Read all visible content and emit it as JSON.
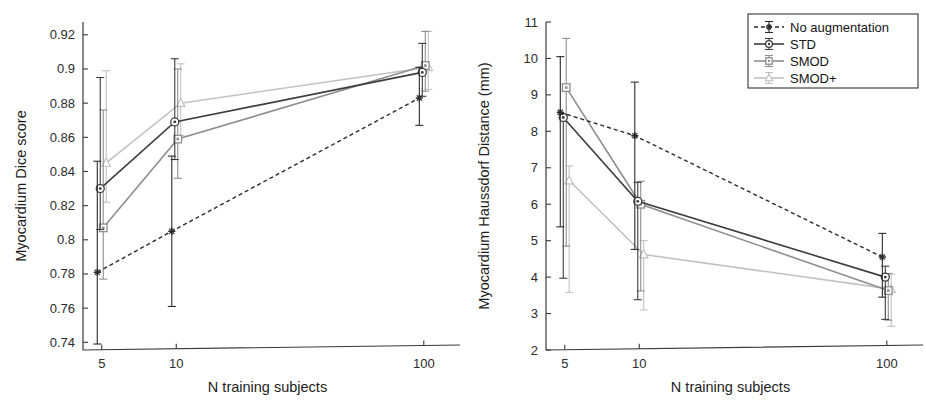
{
  "figure": {
    "title": "",
    "panels": [
      "left",
      "right"
    ]
  },
  "legend": {
    "position": "top-right-of-right-panel",
    "entries": [
      {
        "label": "No augmentation",
        "color": "#2b2b2b",
        "dash": "4,3",
        "marker": "star"
      },
      {
        "label": "STD",
        "color": "#3d3d3d",
        "dash": "none",
        "marker": "circle"
      },
      {
        "label": "SMOD",
        "color": "#8e8e8e",
        "dash": "none",
        "marker": "square"
      },
      {
        "label": "SMOD+",
        "color": "#c2c2c2",
        "dash": "none",
        "marker": "triangle"
      }
    ]
  },
  "chart_data": [
    {
      "id": "dice",
      "type": "line",
      "title": "",
      "xlabel": "N training subjects",
      "ylabel": "Myocardium Dice score",
      "xscale": "log",
      "x": [
        5,
        10,
        100
      ],
      "xticklabels": [
        "5",
        "10",
        "100"
      ],
      "xlim": [
        4.2,
        130
      ],
      "ylim": [
        0.7355,
        0.9275
      ],
      "yticks": [
        0.74,
        0.76,
        0.78,
        0.8,
        0.82,
        0.84,
        0.86,
        0.88,
        0.9,
        0.92
      ],
      "yticklabels": [
        "0.74",
        "0.76",
        "0.78",
        "0.8",
        "0.82",
        "0.84",
        "0.86",
        "0.88",
        "0.9",
        "0.92"
      ],
      "grid": false,
      "series": [
        {
          "name": "No augmentation",
          "color": "#2b2b2b",
          "dash": "4,3",
          "marker": "star",
          "offset": -0.06,
          "values": [
            0.781,
            0.805,
            0.883
          ],
          "err_low": [
            0.739,
            0.761,
            0.867
          ],
          "err_high": [
            0.846,
            0.849,
            0.901
          ]
        },
        {
          "name": "STD",
          "color": "#3d3d3d",
          "dash": "none",
          "marker": "circle",
          "offset": -0.02,
          "values": [
            0.83,
            0.869,
            0.898
          ],
          "err_low": [
            0.806,
            0.847,
            0.884
          ],
          "err_high": [
            0.895,
            0.906,
            0.915
          ]
        },
        {
          "name": "SMOD",
          "color": "#8e8e8e",
          "dash": "none",
          "marker": "square",
          "offset": 0.02,
          "values": [
            0.807,
            0.859,
            0.902
          ],
          "err_low": [
            0.777,
            0.836,
            0.887
          ],
          "err_high": [
            0.876,
            0.9,
            0.922
          ]
        },
        {
          "name": "SMOD+",
          "color": "#c2c2c2",
          "dash": "none",
          "marker": "triangle",
          "offset": 0.06,
          "values": [
            0.845,
            0.88,
            0.901
          ],
          "err_low": [
            0.822,
            0.861,
            0.888
          ],
          "err_high": [
            0.899,
            0.903,
            0.922
          ]
        }
      ]
    },
    {
      "id": "hausdorff",
      "type": "line",
      "title": "",
      "xlabel": "N training subjects",
      "ylabel": "Myocardium Haussdorf Distance (mm)",
      "xscale": "log",
      "x": [
        5,
        10,
        100
      ],
      "xticklabels": [
        "5",
        "10",
        "100"
      ],
      "xlim": [
        4.2,
        130
      ],
      "ylim": [
        2.0,
        11.0
      ],
      "yticks": [
        2,
        3,
        4,
        5,
        6,
        7,
        8,
        9,
        10,
        11
      ],
      "yticklabels": [
        "2",
        "3",
        "4",
        "5",
        "6",
        "7",
        "8",
        "9",
        "10",
        "11"
      ],
      "grid": false,
      "series": [
        {
          "name": "No augmentation",
          "color": "#2b2b2b",
          "dash": "4,3",
          "marker": "star",
          "offset": -0.06,
          "values": [
            8.52,
            7.88,
            4.55
          ],
          "err_low": [
            5.38,
            4.76,
            3.45
          ],
          "err_high": [
            10.05,
            9.35,
            5.2
          ]
        },
        {
          "name": "STD",
          "color": "#3d3d3d",
          "dash": "none",
          "marker": "circle",
          "offset": -0.02,
          "values": [
            8.38,
            6.08,
            4.0
          ],
          "err_low": [
            3.97,
            3.38,
            2.84
          ],
          "err_high": [
            8.45,
            6.6,
            4.3
          ]
        },
        {
          "name": "SMOD",
          "color": "#8e8e8e",
          "dash": "none",
          "marker": "square",
          "offset": 0.02,
          "values": [
            9.2,
            6.0,
            3.63
          ],
          "err_low": [
            4.85,
            3.62,
            2.82
          ],
          "err_high": [
            10.55,
            6.63,
            4.1
          ]
        },
        {
          "name": "SMOD+",
          "color": "#c2c2c2",
          "dash": "none",
          "marker": "triangle",
          "offset": 0.06,
          "values": [
            6.65,
            4.62,
            3.67
          ],
          "err_low": [
            3.58,
            3.1,
            2.65
          ],
          "err_high": [
            7.05,
            5.0,
            4.08
          ]
        }
      ]
    }
  ]
}
